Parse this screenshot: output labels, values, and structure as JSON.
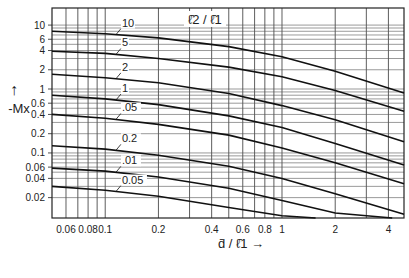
{
  "chart_data": {
    "type": "line",
    "title": "",
    "xlabel": "d̄ / ℓ̄1 →",
    "ylabel": "-Mx",
    "ylabel_arrow": "↑",
    "legend_title": "ℓ̄2 / ℓ̄1",
    "xscale": "log",
    "yscale": "log",
    "xlim": [
      0.05,
      4.9
    ],
    "ylim": [
      0.0096,
      18.5
    ],
    "grid": true,
    "x_ticks": [
      0.06,
      0.08,
      0.1,
      0.2,
      0.4,
      0.6,
      0.8,
      1,
      2,
      4
    ],
    "x_tick_labels": [
      "0.06",
      "0.08",
      "0.1",
      "0.2",
      "0.4",
      "0.6",
      "0.8",
      "1",
      "2",
      "4"
    ],
    "x_minor_grid": [
      0.06,
      0.07,
      0.08,
      0.09,
      0.1,
      0.2,
      0.3,
      0.4,
      0.5,
      0.6,
      0.7,
      0.8,
      0.9,
      1,
      2,
      3,
      4
    ],
    "y_ticks": [
      10,
      6,
      4,
      2,
      1,
      0.6,
      0.4,
      0.2,
      0.1,
      0.06,
      0.04,
      0.02
    ],
    "y_tick_labels": [
      "10",
      "6",
      "4",
      "2",
      "1",
      "0.6",
      "0.4",
      "0.2",
      "0.1",
      "0.06",
      "0.04",
      "0.02"
    ],
    "y_minor_grid": [
      10,
      9,
      8,
      7,
      6,
      5,
      4,
      3,
      2,
      1,
      0.9,
      0.8,
      0.7,
      0.6,
      0.5,
      0.4,
      0.3,
      0.2,
      0.1,
      0.09,
      0.08,
      0.07,
      0.06,
      0.05,
      0.04,
      0.03,
      0.02
    ],
    "series": [
      {
        "name": "10",
        "label": "10",
        "x": [
          0.05,
          0.1,
          0.2,
          0.5,
          1,
          2,
          4.9
        ],
        "y": [
          8.0,
          7.3,
          6.3,
          4.6,
          3.2,
          1.9,
          0.87
        ]
      },
      {
        "name": "5",
        "label": "5",
        "x": [
          0.05,
          0.1,
          0.2,
          0.5,
          1,
          2,
          4.9
        ],
        "y": [
          3.9,
          3.6,
          3.0,
          2.2,
          1.55,
          0.95,
          0.45
        ]
      },
      {
        "name": "2",
        "label": "2",
        "x": [
          0.05,
          0.1,
          0.2,
          0.5,
          1,
          2,
          4.9
        ],
        "y": [
          1.7,
          1.5,
          1.25,
          0.85,
          0.55,
          0.33,
          0.15
        ]
      },
      {
        "name": "1",
        "label": "1",
        "x": [
          0.05,
          0.1,
          0.2,
          0.5,
          1,
          2,
          4.9
        ],
        "y": [
          0.8,
          0.7,
          0.57,
          0.38,
          0.25,
          0.14,
          0.065
        ]
      },
      {
        "name": "0.5",
        "label": ".05",
        "x": [
          0.05,
          0.1,
          0.2,
          0.5,
          1,
          2,
          4.9
        ],
        "y": [
          0.4,
          0.35,
          0.28,
          0.19,
          0.12,
          0.07,
          0.033
        ]
      },
      {
        "name": "0.2",
        "label": "0.2",
        "x": [
          0.05,
          0.1,
          0.2,
          0.5,
          1,
          2,
          4.9
        ],
        "y": [
          0.13,
          0.115,
          0.092,
          0.062,
          0.04,
          0.023,
          0.011
        ]
      },
      {
        "name": "0.1",
        "label": ".01",
        "x": [
          0.05,
          0.1,
          0.2,
          0.5,
          1,
          2,
          4.2
        ],
        "y": [
          0.058,
          0.052,
          0.042,
          0.028,
          0.018,
          0.0115,
          0.0096
        ]
      },
      {
        "name": "0.05",
        "label": "0.05",
        "x": [
          0.05,
          0.1,
          0.2,
          0.5,
          1,
          1.55
        ],
        "y": [
          0.03,
          0.026,
          0.021,
          0.014,
          0.0104,
          0.0096
        ]
      }
    ]
  }
}
